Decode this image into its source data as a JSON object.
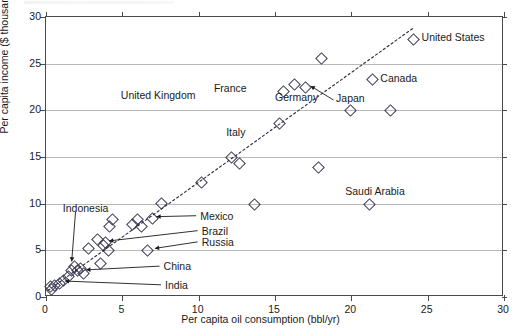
{
  "chart_data": {
    "type": "scatter",
    "title": "",
    "xlabel": "Per capita oil consumption (bbl/yr)",
    "ylabel": "Per capita income ($ thousands)",
    "xlim": [
      0,
      30
    ],
    "ylim": [
      0,
      30
    ],
    "xticks": [
      0,
      5,
      10,
      15,
      20,
      25,
      30
    ],
    "yticks": [
      0,
      5,
      10,
      15,
      20,
      25,
      30
    ],
    "grid": "horizontal",
    "legend": "none",
    "marker": "open-diamond",
    "trendline": {
      "style": "dotted",
      "x": [
        0.2,
        24.2
      ],
      "y": [
        0.6,
        28.8
      ]
    },
    "points": [
      {
        "x": 0.2,
        "y": 1.2,
        "label": ""
      },
      {
        "x": 0.3,
        "y": 0.9,
        "label": ""
      },
      {
        "x": 0.5,
        "y": 1.3,
        "label": "India"
      },
      {
        "x": 0.8,
        "y": 1.6,
        "label": ""
      },
      {
        "x": 1.1,
        "y": 1.9,
        "label": ""
      },
      {
        "x": 1.4,
        "y": 2.3,
        "label": ""
      },
      {
        "x": 1.6,
        "y": 3.0,
        "label": "Indonesia"
      },
      {
        "x": 1.8,
        "y": 3.4,
        "label": ""
      },
      {
        "x": 2.0,
        "y": 2.9,
        "label": ""
      },
      {
        "x": 2.2,
        "y": 3.2,
        "label": ""
      },
      {
        "x": 2.4,
        "y": 2.6,
        "label": "China"
      },
      {
        "x": 2.7,
        "y": 5.3,
        "label": ""
      },
      {
        "x": 3.3,
        "y": 6.3,
        "label": ""
      },
      {
        "x": 3.5,
        "y": 3.7,
        "label": ""
      },
      {
        "x": 3.7,
        "y": 5.6,
        "label": ""
      },
      {
        "x": 3.8,
        "y": 6.0,
        "label": "Brazil"
      },
      {
        "x": 4.0,
        "y": 5.1,
        "label": ""
      },
      {
        "x": 4.1,
        "y": 7.7,
        "label": ""
      },
      {
        "x": 4.3,
        "y": 8.4,
        "label": ""
      },
      {
        "x": 5.6,
        "y": 7.9,
        "label": ""
      },
      {
        "x": 5.9,
        "y": 8.4,
        "label": ""
      },
      {
        "x": 6.2,
        "y": 7.7,
        "label": ""
      },
      {
        "x": 6.6,
        "y": 5.1,
        "label": "Russia"
      },
      {
        "x": 6.9,
        "y": 8.5,
        "label": "Mexico"
      },
      {
        "x": 7.5,
        "y": 10.1,
        "label": ""
      },
      {
        "x": 10.1,
        "y": 12.4,
        "label": ""
      },
      {
        "x": 12.1,
        "y": 15.1,
        "label": ""
      },
      {
        "x": 12.6,
        "y": 14.4,
        "label": ""
      },
      {
        "x": 13.6,
        "y": 10.0,
        "label": ""
      },
      {
        "x": 15.2,
        "y": 18.7,
        "label": ""
      },
      {
        "x": 15.5,
        "y": 22.1,
        "label": "Germany"
      },
      {
        "x": 16.2,
        "y": 22.9,
        "label": ""
      },
      {
        "x": 16.9,
        "y": 22.6,
        "label": ""
      },
      {
        "x": 17.8,
        "y": 14.0,
        "label": ""
      },
      {
        "x": 18.0,
        "y": 25.7,
        "label": ""
      },
      {
        "x": 19.9,
        "y": 20.1,
        "label": "Japan"
      },
      {
        "x": 21.1,
        "y": 10.0,
        "label": "Saudi Arabia"
      },
      {
        "x": 21.3,
        "y": 23.4,
        "label": "Canada"
      },
      {
        "x": 22.5,
        "y": 20.1,
        "label": ""
      },
      {
        "x": 24.0,
        "y": 27.7,
        "label": "United States"
      }
    ],
    "annotations": [
      {
        "text": "United Kingdom",
        "x": 4.9,
        "y": 21.5,
        "kind": "plain"
      },
      {
        "text": "France",
        "x": 11.0,
        "y": 22.3,
        "kind": "plain"
      },
      {
        "text": "Germany",
        "x": 15.0,
        "y": 21.3,
        "kind": "plain"
      },
      {
        "text": "Italy",
        "x": 11.8,
        "y": 17.6,
        "kind": "plain"
      },
      {
        "text": "Japan",
        "x": 19.0,
        "y": 21.2,
        "kind": "leader"
      },
      {
        "text": "Canada",
        "x": 21.9,
        "y": 23.4,
        "kind": "plain"
      },
      {
        "text": "United States",
        "x": 24.6,
        "y": 27.7,
        "kind": "plain"
      },
      {
        "text": "Saudi Arabia",
        "x": 19.6,
        "y": 11.3,
        "kind": "plain"
      },
      {
        "text": "Indonesia",
        "x": 1.1,
        "y": 9.4,
        "kind": "leader"
      },
      {
        "text": "Mexico",
        "x": 10.1,
        "y": 8.6,
        "kind": "leader"
      },
      {
        "text": "Brazil",
        "x": 10.2,
        "y": 7.0,
        "kind": "leader"
      },
      {
        "text": "Russia",
        "x": 10.2,
        "y": 5.8,
        "kind": "leader"
      },
      {
        "text": "China",
        "x": 7.7,
        "y": 3.2,
        "kind": "leader"
      },
      {
        "text": "India",
        "x": 7.8,
        "y": 1.2,
        "kind": "leader"
      }
    ]
  },
  "axis": {
    "x_tick_labels": [
      "0",
      "5",
      "10",
      "15",
      "20",
      "25",
      "30"
    ],
    "y_tick_labels": [
      "0",
      "5",
      "10",
      "15",
      "20",
      "25",
      "30"
    ],
    "x_title": "Per capita oil consumption (bbl/yr)",
    "y_title": "Per capita income ($ thousands)"
  }
}
